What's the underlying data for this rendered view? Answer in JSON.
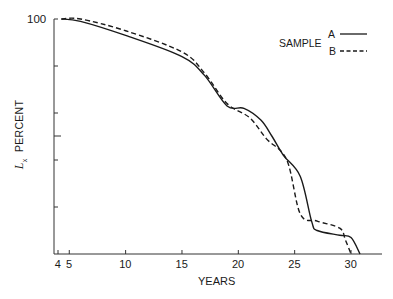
{
  "chart_data": {
    "type": "line",
    "title": "",
    "xlabel": "YEARS",
    "ylabel": "Lx PERCENT",
    "ylabel_symbol": "L",
    "ylabel_subscript": "x",
    "ylabel_text": "PERCENT",
    "x_ticks": [
      4,
      5,
      10,
      15,
      20,
      25,
      30
    ],
    "x_tick_labels": [
      "4",
      "5",
      "10",
      "15",
      "20",
      "25",
      "30"
    ],
    "xlim": [
      4,
      32.5
    ],
    "y_tick_labels": [
      "100"
    ],
    "y_ticks_unlabeled_count": 5,
    "ylim": [
      0,
      100
    ],
    "grid": false,
    "legend": {
      "title": "SAMPLE",
      "position": "upper-right",
      "entries": [
        {
          "label": "A",
          "style": "solid"
        },
        {
          "label": "B",
          "style": "dashed"
        }
      ]
    },
    "series": [
      {
        "name": "A",
        "style": "solid",
        "x": [
          4.3,
          6,
          10,
          15,
          17,
          19,
          20.5,
          22,
          23,
          24,
          25.5,
          26.5,
          27,
          29,
          30,
          30.8
        ],
        "y": [
          100,
          99,
          93,
          84,
          76,
          63,
          62,
          57,
          50,
          42,
          33,
          14,
          10,
          8,
          7,
          0
        ]
      },
      {
        "name": "B",
        "style": "dashed",
        "x": [
          4.3,
          6,
          10,
          15,
          17,
          19,
          21,
          22.5,
          24.3,
          25.5,
          27,
          29,
          29.5,
          30
        ],
        "y": [
          100,
          100,
          95,
          86,
          77,
          64,
          58,
          49,
          40,
          17,
          14,
          11,
          6,
          0
        ]
      }
    ]
  }
}
